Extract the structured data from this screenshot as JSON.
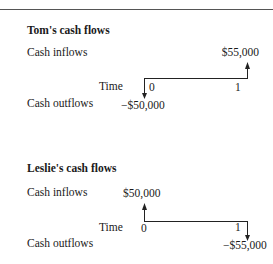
{
  "diagrams": [
    {
      "title": "Tom's cash flows",
      "inflows_label": "Cash inflows",
      "outflows_label": "Cash outflows",
      "time_label": "Time",
      "t0_label": "0",
      "t1_label": "1",
      "t0_flow": "−$50,000",
      "t1_flow": "$55,000",
      "t0_direction": "outflow",
      "t1_direction": "inflow"
    },
    {
      "title": "Leslie's cash flows",
      "inflows_label": "Cash inflows",
      "outflows_label": "Cash outflows",
      "time_label": "Time",
      "t0_label": "0",
      "t1_label": "1",
      "t0_flow": "$50,000",
      "t1_flow": "−$55,000",
      "t0_direction": "inflow",
      "t1_direction": "outflow"
    }
  ],
  "colors": {
    "line": "#222222",
    "text": "#1a1a1a",
    "rule": "#555555"
  }
}
